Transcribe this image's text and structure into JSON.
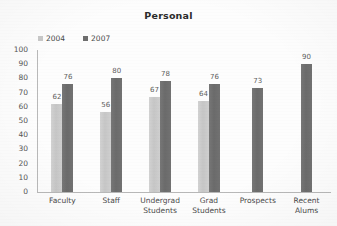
{
  "chart_data": {
    "type": "bar",
    "title": "Personal",
    "xlabel": "",
    "ylabel": "",
    "ylim": [
      0,
      100
    ],
    "ytick_step": 10,
    "yticks": [
      "100",
      "90",
      "80",
      "70",
      "60",
      "50",
      "40",
      "30",
      "20",
      "10",
      "0"
    ],
    "grid": false,
    "legend_position": "top-left",
    "categories": [
      "Faculty",
      "Staff",
      "Undergrad\nStudents",
      "Grad\nStudents",
      "Prospects",
      "Recent\nAlums"
    ],
    "series": [
      {
        "name": "2004",
        "color": "#c8c8c8",
        "values": [
          62,
          56,
          67,
          64,
          null,
          null
        ],
        "labels": [
          "62",
          "56",
          "67",
          "64",
          "",
          ""
        ]
      },
      {
        "name": "2007",
        "color": "#6e6e6e",
        "values": [
          76,
          80,
          78,
          76,
          73,
          90
        ],
        "labels": [
          "76",
          "80",
          "78",
          "76",
          "73",
          "90"
        ]
      }
    ]
  },
  "axis": {
    "axis_color": "#b9b9b9"
  },
  "legend": {
    "entries": [
      {
        "label": "2004",
        "color": "#c8c8c8"
      },
      {
        "label": "2007",
        "color": "#6e6e6e"
      }
    ]
  }
}
